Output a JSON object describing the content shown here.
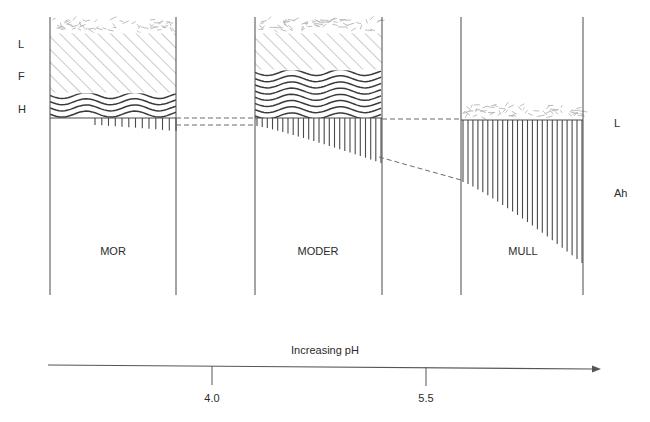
{
  "figure": {
    "type": "soil-profile-diagram"
  },
  "left_horizon_labels": [
    {
      "text": "L",
      "x": 18,
      "y": 38
    },
    {
      "text": "F",
      "x": 18,
      "y": 70
    },
    {
      "text": "H",
      "x": 18,
      "y": 103
    }
  ],
  "right_horizon_labels": [
    {
      "text": "L",
      "x": 614,
      "y": 117
    },
    {
      "text": "Ah",
      "x": 614,
      "y": 187
    }
  ],
  "columns": [
    {
      "name": "MOR",
      "label": "MOR",
      "label_x": 113,
      "label_y": 245,
      "left": 50,
      "right": 176,
      "top": 17,
      "bottom": 295,
      "layers": [
        {
          "horizon": "L",
          "pattern": "litter-flecks",
          "top": 17,
          "bottom": 33
        },
        {
          "horizon": "F",
          "pattern": "diagonal-hatch",
          "top": 33,
          "bottom": 93
        },
        {
          "horizon": "H",
          "pattern": "wavy-lines",
          "top": 93,
          "bottom": 118
        }
      ],
      "roots": {
        "top": 118,
        "start_x": 95,
        "end_x": 176,
        "count": 13,
        "min_len": 7,
        "max_len": 13
      }
    },
    {
      "name": "MODER",
      "label": "MODER",
      "label_x": 318,
      "label_y": 245,
      "left": 255,
      "right": 382,
      "top": 17,
      "bottom": 295,
      "layers": [
        {
          "horizon": "L",
          "pattern": "litter-flecks",
          "top": 17,
          "bottom": 33
        },
        {
          "horizon": "F",
          "pattern": "diagonal-hatch",
          "top": 33,
          "bottom": 70
        },
        {
          "horizon": "H",
          "pattern": "wavy-lines",
          "top": 70,
          "bottom": 118
        }
      ],
      "roots": {
        "top": 118,
        "start_x": 257,
        "end_x": 381,
        "count": 25,
        "min_len": 8,
        "max_len": 45
      }
    },
    {
      "name": "MULL",
      "label": "MULL",
      "label_x": 523,
      "label_y": 245,
      "left": 461,
      "right": 583,
      "top": 17,
      "bottom": 295,
      "layers": [
        {
          "horizon": "L",
          "pattern": "litter-flecks",
          "top": 103,
          "bottom": 120
        }
      ],
      "roots": {
        "top": 120,
        "start_x": 463,
        "end_x": 582,
        "count": 25,
        "min_len": 62,
        "max_len": 143
      }
    }
  ],
  "connector_lines": [
    {
      "name": "mor-moder-upper",
      "x1": 176,
      "y1": 118,
      "x2": 255,
      "y2": 118
    },
    {
      "name": "mor-moder-lower",
      "x1": 176,
      "y1": 125,
      "x2": 255,
      "y2": 125
    },
    {
      "name": "moder-mull-top",
      "x1": 382,
      "y1": 119,
      "x2": 461,
      "y2": 119
    },
    {
      "name": "moder-mull-slope",
      "x1": 379,
      "y1": 157,
      "x2": 461,
      "y2": 180
    }
  ],
  "axis": {
    "caption": "Increasing pH",
    "caption_x": 325,
    "caption_y": 344,
    "line_y_left": 365,
    "line_y_right": 369,
    "x_start": 48,
    "x_end": 592,
    "arrow": "right-arrow",
    "ticks": [
      {
        "label": "4.0",
        "x": 212,
        "y_top": 366,
        "y_bottom": 385,
        "label_y": 392
      },
      {
        "label": "5.5",
        "x": 426,
        "y_top": 367,
        "y_bottom": 386,
        "label_y": 392
      }
    ]
  },
  "colors": {
    "stroke": "#4a4a4a",
    "hatch": "#8a8a8a",
    "wave": "#3a3a3a",
    "flecks": "#b5b5b5",
    "text": "#2b2b2b",
    "axis": "#555555",
    "dashed": "#6b6b6b"
  }
}
